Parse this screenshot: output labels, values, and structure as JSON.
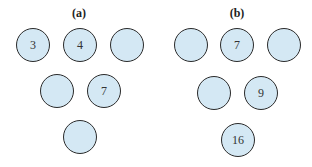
{
  "panels": [
    {
      "title": "(a)",
      "title_x": 79,
      "circles": [
        {
          "x": 33,
          "y": 45,
          "value": "3"
        },
        {
          "x": 80,
          "y": 45,
          "value": "4"
        },
        {
          "x": 127,
          "y": 45,
          "value": ""
        },
        {
          "x": 57,
          "y": 91,
          "value": ""
        },
        {
          "x": 104,
          "y": 91,
          "value": "7"
        },
        {
          "x": 80,
          "y": 137,
          "value": ""
        }
      ]
    },
    {
      "title": "(b)",
      "title_x": 237,
      "circles": [
        {
          "x": 191,
          "y": 45,
          "value": ""
        },
        {
          "x": 237,
          "y": 45,
          "value": "7"
        },
        {
          "x": 284,
          "y": 45,
          "value": ""
        },
        {
          "x": 214,
          "y": 93,
          "value": ""
        },
        {
          "x": 261,
          "y": 93,
          "value": "9"
        },
        {
          "x": 238,
          "y": 140,
          "value": "16"
        }
      ]
    }
  ],
  "colors": {
    "fill": "#d4e8f4",
    "stroke": "#2a2a2a"
  }
}
